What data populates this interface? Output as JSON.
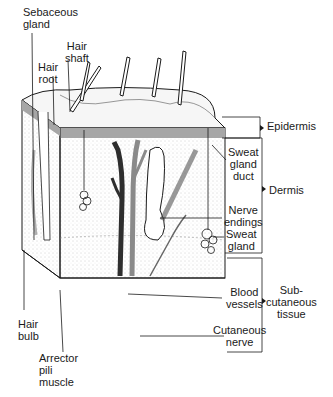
{
  "diagram": {
    "layers": [
      {
        "id": "epidermis",
        "label": "Epidermis"
      },
      {
        "id": "dermis",
        "label": "Dermis"
      },
      {
        "id": "subcutaneous",
        "label": "Sub-\ncutaneous\ntissue"
      }
    ],
    "labels": {
      "sebaceous_gland": "Sebaceous\ngland",
      "hair_shaft": "Hair\nshaft",
      "hair_root": "Hair\nroot",
      "hair_bulb": "Hair\nbulb",
      "arrector_pili": "Arrector\npili\nmuscle",
      "sweat_gland_duct": "Sweat\ngland\nduct",
      "nerve_endings": "Nerve\nendings",
      "sweat_gland": "Sweat\ngland",
      "blood_vessels": "Blood\nvessels",
      "cutaneous_nerve": "Cutaneous\nnerve"
    },
    "colors": {
      "ink": "#1a1a1a",
      "vessel_dark": "#3a3a3a",
      "vessel_light": "#8a8a8a",
      "stipple": "#9a9a9a"
    }
  }
}
